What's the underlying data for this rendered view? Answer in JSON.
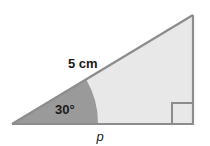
{
  "figure": {
    "background_color": "#ffffff",
    "outline_color": "#8c8c8c",
    "triangle_fill": "#e8e8e8",
    "sector_fill": "#9a9a9a",
    "text_color": "#1a1a1a",
    "labels": {
      "hypotenuse_length": "5 cm",
      "angle": "30°",
      "base_side": "p"
    },
    "right_angle_marker": {
      "name": "right-angle-square",
      "present": true,
      "size_px": 21
    },
    "vertices": {
      "left": [
        12,
        124
      ],
      "apex": [
        193,
        15
      ],
      "right": [
        193,
        124
      ]
    },
    "angle_sector": {
      "radius_px": 86,
      "degrees": 30
    }
  }
}
